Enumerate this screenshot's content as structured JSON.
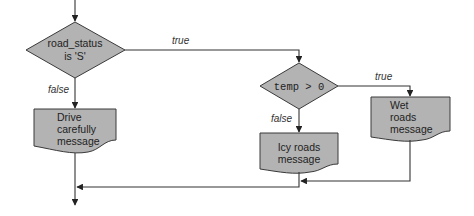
{
  "diagram": {
    "type": "flowchart",
    "colors": {
      "shape_fill": "#b3b3b3",
      "line": "#333333"
    },
    "nodes": {
      "decision1": {
        "line1": "road_status",
        "line2": "is 'S'"
      },
      "output_drive": {
        "line1": "Drive",
        "line2": "carefully",
        "line3": "message"
      },
      "decision2": {
        "label": "temp > 0"
      },
      "output_icy": {
        "line1": "Icy roads",
        "line2": "message"
      },
      "output_wet": {
        "line1": "Wet",
        "line2": "roads",
        "line3": "message"
      }
    },
    "edges": {
      "d1_true": "true",
      "d1_false": "false",
      "d2_true": "true",
      "d2_false": "false"
    }
  }
}
